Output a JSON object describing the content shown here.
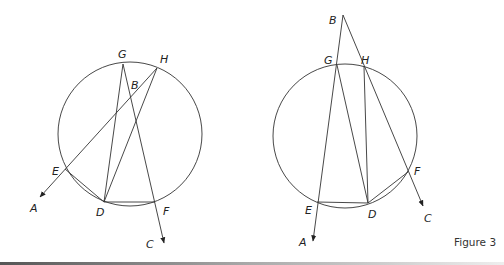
{
  "caption": "Figure 3",
  "figures": [
    {
      "id": "left",
      "circle": {
        "cx": 130,
        "cy": 134,
        "r": 72
      },
      "points": {
        "G": [
          123,
          64
        ],
        "H": [
          157,
          68
        ],
        "B": [
          134,
          95
        ],
        "E": [
          65,
          169
        ],
        "D": [
          104,
          202
        ],
        "F": [
          155,
          202
        ],
        "A": [
          40,
          197
        ],
        "C": [
          164,
          243
        ]
      },
      "labels": {
        "G": "G",
        "H": "H",
        "B": "B",
        "E": "E",
        "D": "D",
        "F": "F",
        "A": "A",
        "C": "C"
      }
    },
    {
      "id": "right",
      "circle": {
        "cx": 345,
        "cy": 136,
        "r": 72
      },
      "points": {
        "B": [
          343,
          15
        ],
        "G": [
          337,
          65
        ],
        "H": [
          364,
          67
        ],
        "E": [
          317,
          202
        ],
        "D": [
          368,
          203
        ],
        "F": [
          408,
          172
        ],
        "A": [
          313,
          241
        ],
        "C": [
          423,
          206
        ]
      },
      "labels": {
        "G": "G",
        "H": "H",
        "B": "B",
        "E": "E",
        "D": "D",
        "F": "F",
        "A": "A",
        "C": "C"
      }
    }
  ]
}
